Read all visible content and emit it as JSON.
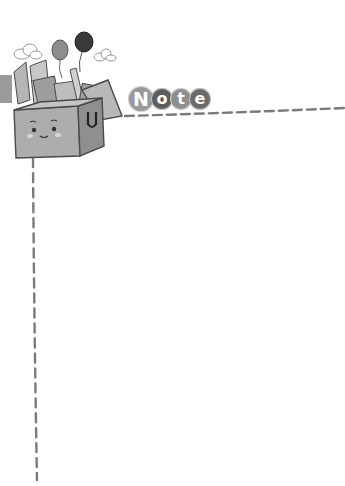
{
  "header": {
    "title_letters": [
      "N",
      "o",
      "t",
      "e"
    ]
  },
  "colors": {
    "background": "#ffffff",
    "dash": "#7a7a7a",
    "letter_bgs": [
      "#9a9a9a",
      "#5c5c5c",
      "#8e8e8e",
      "#6a6a6a"
    ],
    "box_fill": "#a8a8a8",
    "box_stroke": "#4a4a4a"
  },
  "decorations": {
    "illustration": "box-of-school-supplies-with-smiley-face",
    "balloons": 2,
    "clouds": 2
  }
}
